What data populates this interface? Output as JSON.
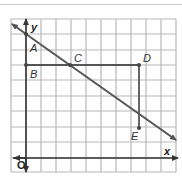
{
  "diagram": {
    "type": "coordinate-grid",
    "grid": {
      "columns": 11,
      "rows": 10,
      "color": "#b5b5b5",
      "border_color": "#999999"
    },
    "axes": {
      "x_label": "x",
      "y_label": "y",
      "origin_label": "O",
      "color": "#333333"
    },
    "points": [
      {
        "name": "A",
        "label": "A"
      },
      {
        "name": "B",
        "label": "B"
      },
      {
        "name": "C",
        "label": "C"
      },
      {
        "name": "D",
        "label": "D"
      },
      {
        "name": "E",
        "label": "E"
      }
    ],
    "line_color": "#555555",
    "segment_color": "#555555"
  }
}
